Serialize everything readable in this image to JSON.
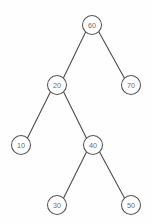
{
  "diagram": {
    "type": "binary-search-tree",
    "background_color": "#fefefe",
    "node_stroke_color": "#555555",
    "node_fill_color": "#ffffff",
    "edge_color": "#4d4d4d",
    "label_color": "#6b6b6b",
    "node_radius": 9.5,
    "nodes": [
      {
        "id": "n60",
        "label": "60",
        "x": 92,
        "y": 25,
        "level": 0,
        "role": "root"
      },
      {
        "id": "n20",
        "label": "20",
        "x": 57,
        "y": 85,
        "level": 1,
        "role": "left-child"
      },
      {
        "id": "n70",
        "label": "70",
        "x": 131,
        "y": 85,
        "level": 1,
        "role": "right-child"
      },
      {
        "id": "n10",
        "label": "10",
        "x": 21,
        "y": 145,
        "level": 2,
        "role": "left-child"
      },
      {
        "id": "n40",
        "label": "40",
        "x": 93,
        "y": 145,
        "level": 2,
        "role": "right-child"
      },
      {
        "id": "n30",
        "label": "30",
        "x": 57,
        "y": 205,
        "level": 3,
        "role": "left-child"
      },
      {
        "id": "n50",
        "label": "50",
        "x": 131,
        "y": 205,
        "level": 3,
        "role": "right-child"
      }
    ],
    "edges": [
      {
        "id": "e60-20",
        "from": "n60",
        "to": "n20",
        "x1": 85.6,
        "y1": 32.0,
        "x2": 63.4,
        "y2": 78.0
      },
      {
        "id": "e60-70",
        "from": "n60",
        "to": "n70",
        "x1": 98.6,
        "y1": 31.6,
        "x2": 124.5,
        "y2": 78.3
      },
      {
        "id": "e20-10",
        "from": "n20",
        "to": "n10",
        "x1": 50.5,
        "y1": 91.7,
        "x2": 27.4,
        "y2": 138.3
      },
      {
        "id": "e20-40",
        "from": "n20",
        "to": "n40",
        "x1": 63.5,
        "y1": 91.8,
        "x2": 86.5,
        "y2": 138.3
      },
      {
        "id": "e40-30",
        "from": "n40",
        "to": "n30",
        "x1": 86.6,
        "y1": 151.8,
        "x2": 63.5,
        "y2": 198.3
      },
      {
        "id": "e40-50",
        "from": "n40",
        "to": "n50",
        "x1": 99.5,
        "y1": 151.7,
        "x2": 124.6,
        "y2": 198.2
      }
    ]
  }
}
